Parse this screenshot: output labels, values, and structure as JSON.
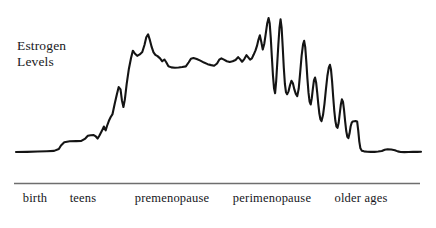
{
  "figure": {
    "background_color": "#ffffff",
    "axis_line_color": "#6e6e6e",
    "curve_color": "#141414",
    "text_color": "#17171b"
  },
  "y_axis": {
    "caption_line_1": "Estrogen",
    "caption_line_2": "Levels"
  },
  "chart_data": {
    "type": "line",
    "title": "",
    "subtitle": "",
    "xlabel": "",
    "ylabel": "Estrogen Levels",
    "grid": false,
    "legend": "none",
    "axis_line": true,
    "y_axis_ticks_shown": false,
    "x_axis_ticks_shown": false,
    "xlim": [
      0,
      100
    ],
    "ylim": [
      0,
      100
    ],
    "categories": [
      "birth",
      "teens",
      "premenopause",
      "perimenopause",
      "older ages"
    ],
    "category_centers_pct": [
      8.1,
      19.1,
      39.5,
      62.3,
      82.8
    ],
    "annotations": [],
    "series": [
      {
        "name": "Estrogen Levels",
        "description": "Low flat level from birth through childhood, a stepped rise during the teens to a high sustained plateau through premenopause, violent erratic spikes and crashes during perimenopause, then a drop to a low flat level in older ages.",
        "points": [
          [
            1.0,
            12.5
          ],
          [
            4.0,
            12.6
          ],
          [
            7.0,
            12.8
          ],
          [
            9.5,
            13.0
          ],
          [
            11.5,
            13.2
          ],
          [
            12.8,
            14.4
          ],
          [
            13.4,
            16.6
          ],
          [
            14.3,
            18.6
          ],
          [
            15.8,
            19.2
          ],
          [
            17.6,
            19.3
          ],
          [
            19.0,
            19.4
          ],
          [
            20.1,
            20.9
          ],
          [
            20.8,
            22.6
          ],
          [
            21.6,
            23.0
          ],
          [
            22.4,
            23.1
          ],
          [
            23.0,
            22.2
          ],
          [
            23.5,
            20.9
          ],
          [
            24.0,
            22.8
          ],
          [
            24.6,
            25.4
          ],
          [
            25.2,
            28.4
          ],
          [
            25.7,
            26.0
          ],
          [
            26.1,
            28.9
          ],
          [
            26.6,
            32.0
          ],
          [
            27.1,
            34.4
          ],
          [
            27.6,
            36.2
          ],
          [
            28.2,
            42.6
          ],
          [
            28.8,
            48.6
          ],
          [
            29.3,
            53.1
          ],
          [
            29.8,
            51.6
          ],
          [
            30.2,
            44.6
          ],
          [
            30.6,
            40.6
          ],
          [
            31.0,
            45.4
          ],
          [
            31.5,
            55.1
          ],
          [
            32.1,
            64.4
          ],
          [
            32.7,
            71.2
          ],
          [
            33.2,
            75.8
          ],
          [
            33.8,
            73.9
          ],
          [
            34.4,
            72.6
          ],
          [
            35.1,
            73.5
          ],
          [
            35.8,
            75.0
          ],
          [
            36.4,
            79.4
          ],
          [
            36.9,
            84.2
          ],
          [
            37.4,
            86.0
          ],
          [
            37.9,
            82.4
          ],
          [
            38.4,
            78.0
          ],
          [
            38.9,
            74.8
          ],
          [
            39.4,
            73.2
          ],
          [
            40.0,
            72.4
          ],
          [
            40.7,
            71.0
          ],
          [
            41.3,
            69.2
          ],
          [
            41.9,
            70.3
          ],
          [
            42.4,
            68.6
          ],
          [
            43.0,
            66.1
          ],
          [
            43.8,
            65.4
          ],
          [
            44.8,
            65.2
          ],
          [
            45.8,
            65.3
          ],
          [
            46.8,
            65.6
          ],
          [
            47.8,
            66.0
          ],
          [
            48.6,
            68.6
          ],
          [
            49.2,
            70.8
          ],
          [
            49.9,
            71.2
          ],
          [
            50.8,
            70.6
          ],
          [
            51.8,
            69.6
          ],
          [
            52.8,
            68.4
          ],
          [
            53.8,
            67.4
          ],
          [
            54.8,
            66.8
          ],
          [
            55.6,
            66.4
          ],
          [
            56.4,
            67.8
          ],
          [
            57.0,
            70.2
          ],
          [
            57.6,
            71.0
          ],
          [
            58.3,
            70.2
          ],
          [
            59.1,
            69.2
          ],
          [
            59.9,
            68.8
          ],
          [
            60.7,
            69.2
          ],
          [
            61.5,
            70.0
          ],
          [
            62.2,
            71.8
          ],
          [
            62.8,
            70.4
          ],
          [
            63.3,
            68.9
          ],
          [
            63.9,
            70.6
          ],
          [
            64.5,
            73.0
          ],
          [
            65.0,
            71.6
          ],
          [
            65.5,
            70.2
          ],
          [
            66.0,
            71.0
          ],
          [
            66.5,
            73.4
          ],
          [
            67.0,
            76.0
          ],
          [
            67.4,
            78.8
          ],
          [
            67.8,
            82.6
          ],
          [
            68.2,
            85.4
          ],
          [
            68.6,
            81.2
          ],
          [
            69.0,
            76.6
          ],
          [
            69.4,
            80.0
          ],
          [
            69.8,
            86.2
          ],
          [
            70.2,
            92.6
          ],
          [
            70.6,
            96.2
          ],
          [
            70.9,
            93.0
          ],
          [
            71.2,
            84.0
          ],
          [
            71.5,
            72.0
          ],
          [
            71.8,
            60.6
          ],
          [
            72.1,
            52.4
          ],
          [
            72.4,
            49.2
          ],
          [
            72.7,
            57.0
          ],
          [
            73.0,
            68.4
          ],
          [
            73.3,
            80.0
          ],
          [
            73.6,
            90.0
          ],
          [
            73.9,
            95.4
          ],
          [
            74.2,
            90.0
          ],
          [
            74.5,
            78.0
          ],
          [
            74.8,
            65.0
          ],
          [
            75.1,
            55.0
          ],
          [
            75.4,
            49.8
          ],
          [
            75.7,
            48.6
          ],
          [
            76.1,
            50.4
          ],
          [
            76.5,
            54.2
          ],
          [
            76.9,
            57.0
          ],
          [
            77.3,
            55.4
          ],
          [
            77.7,
            51.6
          ],
          [
            78.1,
            48.8
          ],
          [
            78.5,
            47.4
          ],
          [
            78.9,
            52.0
          ],
          [
            79.3,
            62.0
          ],
          [
            79.7,
            72.6
          ],
          [
            80.1,
            79.8
          ],
          [
            80.4,
            82.0
          ],
          [
            80.7,
            78.0
          ],
          [
            81.0,
            69.0
          ],
          [
            81.3,
            58.4
          ],
          [
            81.6,
            49.6
          ],
          [
            81.9,
            44.0
          ],
          [
            82.2,
            42.2
          ],
          [
            82.5,
            46.0
          ],
          [
            82.8,
            52.0
          ],
          [
            83.1,
            57.2
          ],
          [
            83.4,
            59.0
          ],
          [
            83.7,
            56.0
          ],
          [
            84.0,
            49.6
          ],
          [
            84.3,
            42.4
          ],
          [
            84.6,
            36.4
          ],
          [
            84.9,
            32.8
          ],
          [
            85.2,
            31.8
          ],
          [
            85.6,
            35.6
          ],
          [
            86.0,
            42.6
          ],
          [
            86.4,
            51.6
          ],
          [
            86.8,
            60.0
          ],
          [
            87.2,
            65.4
          ],
          [
            87.5,
            67.0
          ],
          [
            87.8,
            64.0
          ],
          [
            88.1,
            56.6
          ],
          [
            88.4,
            47.0
          ],
          [
            88.7,
            38.4
          ],
          [
            89.0,
            32.0
          ],
          [
            89.3,
            28.4
          ],
          [
            89.6,
            27.6
          ],
          [
            89.9,
            30.6
          ],
          [
            90.2,
            36.4
          ],
          [
            90.5,
            42.0
          ],
          [
            90.8,
            45.4
          ],
          [
            91.1,
            44.0
          ],
          [
            91.4,
            38.6
          ],
          [
            91.7,
            31.6
          ],
          [
            92.0,
            25.6
          ],
          [
            92.3,
            22.0
          ],
          [
            92.6,
            21.2
          ],
          [
            92.9,
            24.0
          ],
          [
            93.2,
            28.4
          ],
          [
            93.5,
            30.8
          ],
          [
            93.8,
            31.6
          ],
          [
            94.2,
            31.7
          ],
          [
            94.6,
            31.8
          ],
          [
            95.0,
            31.6
          ],
          [
            95.3,
            26.0
          ],
          [
            95.6,
            19.0
          ],
          [
            95.9,
            14.8
          ],
          [
            96.3,
            13.3
          ],
          [
            96.9,
            12.9
          ],
          [
            97.8,
            12.7
          ],
          [
            98.8,
            12.6
          ],
          [
            99.8,
            12.6
          ],
          [
            100.8,
            12.8
          ],
          [
            101.8,
            13.1
          ],
          [
            102.6,
            13.9
          ],
          [
            103.4,
            14.2
          ],
          [
            104.4,
            14.1
          ],
          [
            105.4,
            13.6
          ],
          [
            106.2,
            12.9
          ],
          [
            107.0,
            12.5
          ],
          [
            108.0,
            12.4
          ],
          [
            109.2,
            12.5
          ],
          [
            110.4,
            12.6
          ],
          [
            111.6,
            12.6
          ],
          [
            112.6,
            12.7
          ]
        ]
      }
    ]
  },
  "x_axis": {
    "labels": [
      {
        "text": "birth",
        "center_px": 35
      },
      {
        "text": "teens",
        "center_px": 83
      },
      {
        "text": "premenopause",
        "center_px": 172
      },
      {
        "text": "perimenopause",
        "center_px": 272
      },
      {
        "text": "older ages",
        "center_px": 361
      }
    ]
  }
}
